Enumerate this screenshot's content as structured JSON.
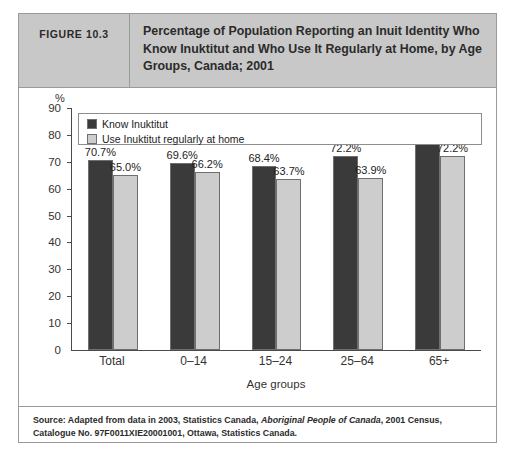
{
  "figure": {
    "number_label": "FIGURE 10.3",
    "title": "Percentage of Population Reporting an Inuit Identity Who Know Inuktitut and Who Use It Regularly at Home, by Age Groups, Canada; 2001"
  },
  "source": {
    "prefix": "Source: Adapted from data in 2003, Statistics Canada, ",
    "italic": "Aboriginal People of Canada",
    "suffix": ", 2001 Census, Catalogue No. 97F0011XIE20001001, Ottawa, Statistics Canada."
  },
  "colors": {
    "series_1": "#3a3a3a",
    "series_2": "#cdcdcd",
    "header_band": "#c8c8c8",
    "frame_border": "#9a9a9a",
    "axis": "#4a4a4a"
  },
  "chart_data": {
    "type": "bar",
    "title": "Percentage of Population Reporting an Inuit Identity Who Know Inuktitut and Who Use It Regularly at Home, by Age Groups, Canada; 2001",
    "xlabel": "Age groups",
    "ylabel": "%",
    "ylim": [
      0,
      90
    ],
    "yticks": [
      0,
      10,
      20,
      30,
      40,
      50,
      60,
      70,
      80,
      90
    ],
    "ytick_labels": [
      "0",
      "10",
      "20",
      "30",
      "40",
      "50",
      "60",
      "70",
      "80",
      "90"
    ],
    "grid": false,
    "legend_position": "upper-left",
    "categories": [
      "Total",
      "0–14",
      "15–24",
      "25–64",
      "65+"
    ],
    "series": [
      {
        "name": "Know Inuktitut",
        "color": "#3a3a3a",
        "values": [
          70.7,
          69.6,
          68.4,
          72.2,
          78.6
        ],
        "labels": [
          "70.7%",
          "69.6%",
          "68.4%",
          "72.2%",
          "78.6%"
        ]
      },
      {
        "name": "Use Inuktitut regularly at home",
        "color": "#cdcdcd",
        "values": [
          65.0,
          66.2,
          63.7,
          63.9,
          72.2
        ],
        "labels": [
          "65.0%",
          "66.2%",
          "63.7%",
          "63.9%",
          "72.2%"
        ]
      }
    ]
  }
}
